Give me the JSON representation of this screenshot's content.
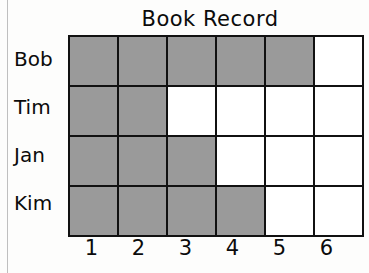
{
  "chart_data": {
    "type": "heatmap",
    "title": "Book Record",
    "xlabel": "",
    "ylabel": "",
    "grid": true,
    "legend": "none",
    "categories": [
      "1",
      "2",
      "3",
      "4",
      "5",
      "6"
    ],
    "rows": [
      "Bob",
      "Tim",
      "Jan",
      "Kim"
    ],
    "series": [
      {
        "name": "Bob",
        "values": [
          1,
          1,
          1,
          1,
          1,
          0
        ]
      },
      {
        "name": "Tim",
        "values": [
          1,
          1,
          0,
          0,
          0,
          0
        ]
      },
      {
        "name": "Jan",
        "values": [
          1,
          1,
          1,
          0,
          0,
          0
        ]
      },
      {
        "name": "Kim",
        "values": [
          1,
          1,
          1,
          1,
          0,
          0
        ]
      }
    ],
    "totals": {
      "Bob": 5,
      "Tim": 2,
      "Jan": 3,
      "Kim": 4
    },
    "colors": {
      "filled": "#9a9a9a",
      "empty": "#ffffff",
      "border": "#111111"
    }
  }
}
